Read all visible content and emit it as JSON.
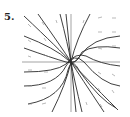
{
  "figure": {
    "label": "5.",
    "type": "direction-field-phase-portrait",
    "axes": {
      "origin_px": [
        71,
        62
      ],
      "x_extent_px": [
        22,
        120
      ],
      "y_extent_px": [
        14,
        112
      ]
    },
    "colors": {
      "curves": "#2a2a2a",
      "arrows": "#8a8a8a",
      "axes": "#555555"
    }
  }
}
